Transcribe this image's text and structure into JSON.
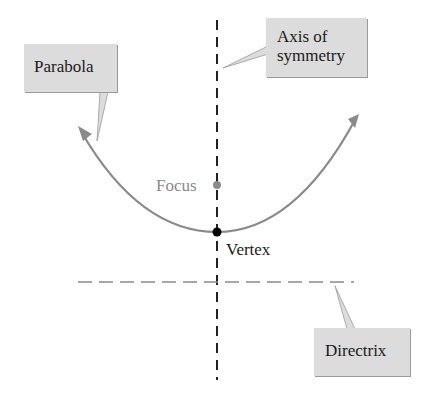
{
  "diagram": {
    "labels": {
      "parabola": "Parabola",
      "axis_line1": "Axis of",
      "axis_line2": "symmetry",
      "focus": "Focus",
      "vertex": "Vertex",
      "directrix": "Directrix"
    },
    "colors": {
      "curve": "#8a8a8a",
      "axis": "#222222",
      "directrix": "#8a8a8a",
      "callout_bg": "#dcdcdc",
      "focus_text": "#8a8a8a",
      "vertex_dot": "#000000"
    }
  }
}
